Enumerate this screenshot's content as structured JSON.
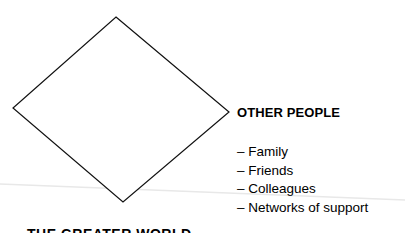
{
  "diagram": {
    "shape": {
      "type": "diamond",
      "points": [
        [
          116,
          17
        ],
        [
          229,
          112
        ],
        [
          123,
          202
        ],
        [
          13,
          108
        ]
      ],
      "stroke": "#111111",
      "fill": "#ffffff"
    },
    "faint_line": {
      "from": [
        0,
        184
      ],
      "to": [
        405,
        200
      ],
      "color": "#e6e6e6"
    },
    "section": {
      "heading": "OTHER PEOPLE",
      "items": [
        {
          "label": "– Family"
        },
        {
          "label": "– Friends"
        },
        {
          "label": "– Colleagues"
        },
        {
          "label": "– Networks of support"
        }
      ]
    },
    "bottom_heading": "THE GREATER WORLD"
  }
}
